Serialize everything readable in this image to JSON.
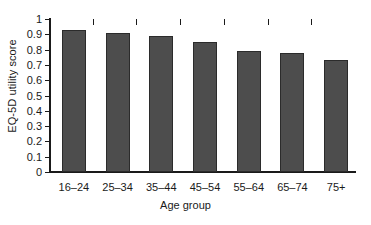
{
  "chart_data": {
    "type": "bar",
    "title": "",
    "xlabel": "Age group",
    "ylabel": "EQ-5D utility score",
    "categories": [
      "16–24",
      "25–34",
      "35–44",
      "45–54",
      "55–64",
      "65–74",
      "75+"
    ],
    "values": [
      0.93,
      0.91,
      0.89,
      0.85,
      0.79,
      0.78,
      0.73
    ],
    "ylim": [
      0,
      1
    ],
    "ytick_labels": [
      "0",
      "0.1",
      "0.2",
      "0.3",
      "0.4",
      "0.5",
      "0.6",
      "0.7",
      "0.8",
      "0.9",
      "1"
    ],
    "ytick_values": [
      0,
      0.1,
      0.2,
      0.3,
      0.4,
      0.5,
      0.6,
      0.7,
      0.8,
      0.9,
      1
    ],
    "grid": false,
    "legend": false,
    "legend_position": "none",
    "bar_color": "#4d4d4d",
    "bar_edge_color": "#2b2b2b",
    "axis_color": "#1a1a1a",
    "background_color": "#ffffff"
  }
}
